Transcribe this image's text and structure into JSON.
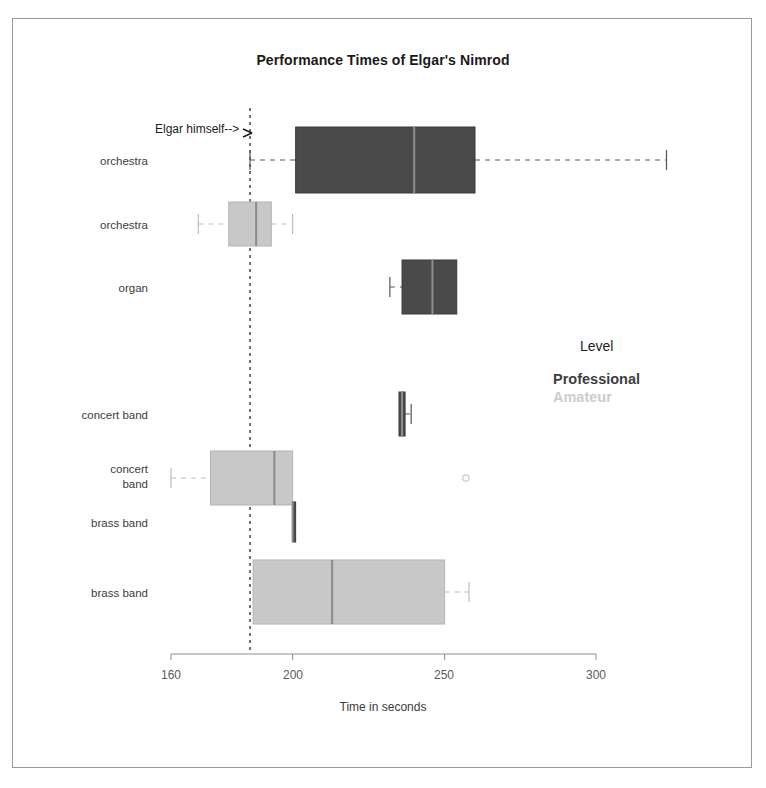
{
  "figure": {
    "title": "Performance Times of Elgar's Nimrod",
    "xlabel": "Time in seconds",
    "annotation": "Elgar himself-->"
  },
  "legend": {
    "title": "Level",
    "entries": [
      {
        "label": "Professional",
        "color": "#4a4a4a"
      },
      {
        "label": "Amateur",
        "color": "#c8c8c8"
      }
    ]
  },
  "axis": {
    "ticks": [
      "160",
      "200",
      "250",
      "300"
    ]
  },
  "categories": [
    {
      "label": "orchestra"
    },
    {
      "label": "orchestra"
    },
    {
      "label": "organ"
    },
    {
      "label": "concert band"
    },
    {
      "label_line1": "concert",
      "label_line2": "band"
    },
    {
      "label": "brass band"
    },
    {
      "label": "brass band"
    }
  ],
  "chart_data": {
    "type": "box",
    "orientation": "horizontal",
    "title": "Performance Times of Elgar's Nimrod",
    "xlabel": "Time in seconds",
    "ylabel": "",
    "xlim": [
      157,
      324
    ],
    "xticks": [
      160,
      200,
      250,
      300
    ],
    "grid": false,
    "legend": {
      "title": "Level",
      "position": "right",
      "entries": [
        "Professional",
        "Amateur"
      ]
    },
    "reference_line": {
      "value": 186,
      "style": "dashed",
      "label": "Elgar himself-->"
    },
    "boxes": [
      {
        "category": "orchestra",
        "level": "Professional",
        "color": "#4a4a4a",
        "whisker_low": 186,
        "q1": 201,
        "median": 240,
        "q3": 260,
        "whisker_high": 323,
        "outliers": []
      },
      {
        "category": "orchestra",
        "level": "Amateur",
        "color": "#c8c8c8",
        "whisker_low": 169,
        "q1": 179,
        "median": 188,
        "q3": 193,
        "whisker_high": 200,
        "outliers": []
      },
      {
        "category": "organ",
        "level": "Professional",
        "color": "#4a4a4a",
        "whisker_low": 232,
        "q1": 236,
        "median": 246,
        "q3": 254,
        "whisker_high": 254,
        "outliers": []
      },
      {
        "category": "concert band",
        "level": "Professional",
        "color": "#4a4a4a",
        "whisker_low": 235,
        "q1": 235,
        "median": 236,
        "q3": 237,
        "whisker_high": 239,
        "outliers": []
      },
      {
        "category": "concert band",
        "level": "Amateur",
        "color": "#c8c8c8",
        "whisker_low": 160,
        "q1": 173,
        "median": 194,
        "q3": 200,
        "whisker_high": 200,
        "outliers": [
          257
        ]
      },
      {
        "category": "brass band",
        "level": "Professional",
        "color": "#4a4a4a",
        "whisker_low": 200,
        "q1": 200,
        "median": 200,
        "q3": 201,
        "whisker_high": 201,
        "outliers": []
      },
      {
        "category": "brass band",
        "level": "Amateur",
        "color": "#c8c8c8",
        "whisker_low": 187,
        "q1": 187,
        "median": 213,
        "q3": 250,
        "whisker_high": 258,
        "outliers": []
      }
    ]
  }
}
